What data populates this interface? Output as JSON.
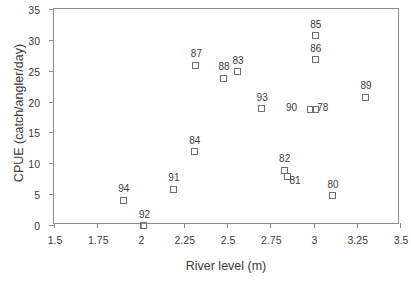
{
  "chart_data": {
    "type": "scatter",
    "title": "",
    "xlabel": "River level (m)",
    "ylabel": "CPUE (catch/angler/day)",
    "xlim": [
      1.5,
      3.5
    ],
    "ylim": [
      0,
      35
    ],
    "xticks": [
      "1.5",
      "1.75",
      "2",
      "2.25",
      "2.5",
      "2.75",
      "3",
      "3.25",
      "3.5"
    ],
    "xtick_values": [
      1.5,
      1.75,
      2,
      2.25,
      2.5,
      2.75,
      3,
      3.25,
      3.5
    ],
    "yticks": [
      "0",
      "5",
      "10",
      "15",
      "20",
      "25",
      "30",
      "35"
    ],
    "ytick_values": [
      0,
      5,
      10,
      15,
      20,
      25,
      30,
      35
    ],
    "grid": false,
    "legend": false,
    "marker": "open-square",
    "marker_color": "#6f6f6f",
    "series": [
      {
        "name": "Annual CPUE vs river level",
        "points": [
          {
            "label": "94",
            "x": 1.9,
            "y": 4.0,
            "label_dx": -1,
            "label_dy": -13
          },
          {
            "label": "92",
            "x": 2.02,
            "y": -0.1,
            "label_dx": -1,
            "label_dy": -13
          },
          {
            "label": "91",
            "x": 2.19,
            "y": 5.8,
            "label_dx": -1,
            "label_dy": -13
          },
          {
            "label": "84",
            "x": 2.31,
            "y": 11.9,
            "label_dx": -1,
            "label_dy": -13
          },
          {
            "label": "87",
            "x": 2.32,
            "y": 25.9,
            "label_dx": -1,
            "label_dy": -13
          },
          {
            "label": "88",
            "x": 2.48,
            "y": 23.8,
            "label_dx": -1,
            "label_dy": -13
          },
          {
            "label": "83",
            "x": 2.56,
            "y": 24.8,
            "label_dx": -1,
            "label_dy": -13
          },
          {
            "label": "93",
            "x": 2.7,
            "y": 18.8,
            "label_dx": -1,
            "label_dy": -13
          },
          {
            "label": "82",
            "x": 2.83,
            "y": 8.9,
            "label_dx": -1,
            "label_dy": -13
          },
          {
            "label": "81",
            "x": 2.85,
            "y": 7.8,
            "label_dx": 6,
            "label_dy": 2
          },
          {
            "label": "90",
            "x": 2.98,
            "y": 18.7,
            "label_dx": -20,
            "label_dy": -4
          },
          {
            "label": "78",
            "x": 3.01,
            "y": 18.7,
            "label_dx": 6,
            "label_dy": -4
          },
          {
            "label": "85",
            "x": 3.01,
            "y": 30.7,
            "label_dx": -1,
            "label_dy": -13
          },
          {
            "label": "86",
            "x": 3.01,
            "y": 26.8,
            "label_dx": -1,
            "label_dy": -13
          },
          {
            "label": "80",
            "x": 3.11,
            "y": 4.7,
            "label_dx": -1,
            "label_dy": -13
          },
          {
            "label": "89",
            "x": 3.3,
            "y": 20.7,
            "label_dx": -1,
            "label_dy": -13
          }
        ]
      }
    ]
  }
}
